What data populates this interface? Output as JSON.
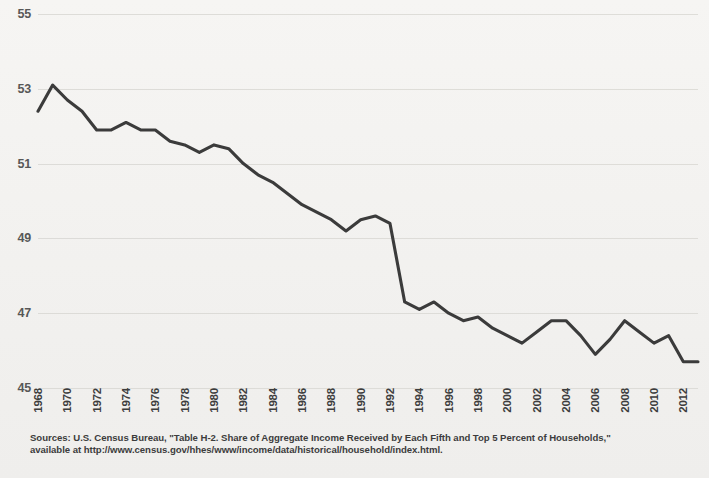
{
  "chart_data": {
    "type": "line",
    "title": "",
    "subtitle": "",
    "xlabel": "",
    "ylabel": "",
    "grid": true,
    "legend": "none",
    "xlim": [
      1968,
      2013
    ],
    "ylim": [
      45,
      55
    ],
    "yticks": [
      45,
      47,
      49,
      51,
      53,
      55
    ],
    "xticks": [
      1968,
      1970,
      1972,
      1974,
      1976,
      1978,
      1980,
      1982,
      1984,
      1986,
      1988,
      1990,
      1992,
      1994,
      1996,
      1998,
      2000,
      2002,
      2004,
      2006,
      2008,
      2010,
      2012
    ],
    "line_color": "#3b3b3b",
    "series": [
      {
        "name": "Share of aggregate income, bottom four fifths of households (percent)",
        "x": [
          1968,
          1969,
          1970,
          1971,
          1972,
          1973,
          1974,
          1975,
          1976,
          1977,
          1978,
          1979,
          1980,
          1981,
          1982,
          1983,
          1984,
          1985,
          1986,
          1987,
          1988,
          1989,
          1990,
          1991,
          1992,
          1993,
          1994,
          1995,
          1996,
          1997,
          1998,
          1999,
          2000,
          2001,
          2002,
          2003,
          2004,
          2005,
          2006,
          2007,
          2008,
          2009,
          2010,
          2011,
          2012,
          2013
        ],
        "values": [
          52.4,
          53.1,
          52.7,
          52.4,
          51.9,
          51.9,
          52.1,
          51.9,
          51.9,
          51.6,
          51.5,
          51.3,
          51.5,
          51.4,
          51.0,
          50.7,
          50.5,
          50.2,
          49.9,
          49.7,
          49.5,
          49.2,
          49.5,
          49.6,
          49.4,
          47.3,
          47.1,
          47.3,
          47.0,
          46.8,
          46.9,
          46.6,
          46.4,
          46.2,
          46.5,
          46.8,
          46.8,
          46.4,
          45.9,
          46.3,
          46.8,
          46.5,
          46.2,
          46.4,
          45.7,
          45.7
        ]
      }
    ],
    "source_lines": [
      "Sources: U.S. Census Bureau, \"Table H-2. Share of Aggregate Income Received by Each Fifth and Top 5 Percent of Households,\"",
      "available at http://www.census.gov/hhes/www/income/data/historical/household/index.html."
    ]
  }
}
